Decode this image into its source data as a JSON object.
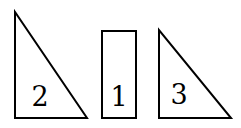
{
  "diagram": {
    "shapes": [
      {
        "type": "right-triangle",
        "label": "2",
        "points": [
          [
            15,
            12
          ],
          [
            15,
            118
          ],
          [
            87,
            118
          ]
        ]
      },
      {
        "type": "rectangle",
        "label": "1",
        "x": 102,
        "y": 31,
        "width": 34,
        "height": 87
      },
      {
        "type": "right-triangle",
        "label": "3",
        "points": [
          [
            159,
            30
          ],
          [
            159,
            118
          ],
          [
            231,
            118
          ]
        ]
      }
    ],
    "labels": {
      "triangle_left": "2",
      "rectangle": "1",
      "triangle_right": "3"
    },
    "stroke_color": "#000000",
    "background": "#ffffff"
  }
}
